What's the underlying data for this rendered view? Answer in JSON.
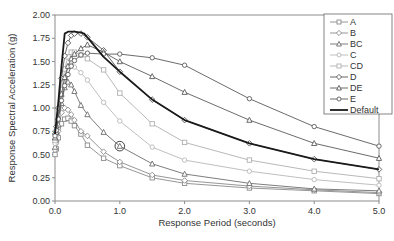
{
  "chart_data": {
    "type": "line",
    "title": "",
    "xlabel": "Response Period (seconds)",
    "ylabel": "Response Spectral Acceleration (g)",
    "xlim": [
      0.0,
      5.0
    ],
    "ylim": [
      0.0,
      2.0
    ],
    "x_ticks": [
      "0.0",
      "1.0",
      "2.0",
      "3.0",
      "4.0",
      "5.0"
    ],
    "y_ticks": [
      "0.00",
      "0.25",
      "0.50",
      "0.75",
      "1.00",
      "1.25",
      "1.50",
      "1.75",
      "2.00"
    ],
    "grid": false,
    "legend_position": "upper right",
    "series": [
      {
        "name": "A",
        "marker": "square",
        "color": "#8a8a8a",
        "x": [
          0.0,
          0.02,
          0.05,
          0.1,
          0.15,
          0.2,
          0.25,
          0.3,
          0.4,
          0.5,
          0.75,
          1.0,
          1.5,
          2.0,
          3.0,
          4.0,
          5.0
        ],
        "y": [
          0.5,
          0.56,
          0.68,
          0.83,
          0.88,
          0.89,
          0.86,
          0.81,
          0.72,
          0.6,
          0.46,
          0.38,
          0.25,
          0.19,
          0.14,
          0.11,
          0.08
        ]
      },
      {
        "name": "B",
        "marker": "diamond",
        "color": "#8a8a8a",
        "x": [
          0.0,
          0.02,
          0.05,
          0.1,
          0.15,
          0.2,
          0.25,
          0.3,
          0.4,
          0.5,
          0.75,
          1.0,
          1.5,
          2.0,
          3.0,
          4.0,
          5.0
        ],
        "y": [
          0.55,
          0.62,
          0.75,
          0.95,
          1.0,
          0.98,
          0.93,
          0.87,
          0.75,
          0.7,
          0.53,
          0.42,
          0.28,
          0.22,
          0.16,
          0.12,
          0.09
        ]
      },
      {
        "name": "BC",
        "marker": "triangle",
        "color": "#6e6e6e",
        "x": [
          0.0,
          0.02,
          0.05,
          0.1,
          0.15,
          0.2,
          0.25,
          0.3,
          0.4,
          0.5,
          0.75,
          1.0,
          1.5,
          2.0,
          3.0,
          4.0,
          5.0
        ],
        "y": [
          0.58,
          0.66,
          0.82,
          1.05,
          1.22,
          1.28,
          1.25,
          1.18,
          1.03,
          0.93,
          0.74,
          0.59,
          0.4,
          0.29,
          0.19,
          0.13,
          0.11
        ]
      },
      {
        "name": "C",
        "marker": "circle",
        "color": "#b8b8b8",
        "x": [
          0.0,
          0.02,
          0.05,
          0.1,
          0.15,
          0.2,
          0.25,
          0.3,
          0.4,
          0.5,
          0.75,
          1.0,
          1.5,
          2.0,
          3.0,
          4.0,
          5.0
        ],
        "y": [
          0.62,
          0.7,
          0.88,
          1.12,
          1.32,
          1.44,
          1.46,
          1.44,
          1.38,
          1.3,
          1.06,
          0.86,
          0.58,
          0.44,
          0.32,
          0.23,
          0.17
        ]
      },
      {
        "name": "CD",
        "marker": "square",
        "color": "#b0b0b0",
        "x": [
          0.0,
          0.02,
          0.05,
          0.1,
          0.15,
          0.2,
          0.25,
          0.3,
          0.4,
          0.5,
          0.75,
          1.0,
          1.5,
          2.0,
          3.0,
          4.0,
          5.0
        ],
        "y": [
          0.65,
          0.73,
          0.92,
          1.2,
          1.42,
          1.55,
          1.6,
          1.6,
          1.57,
          1.53,
          1.41,
          1.16,
          0.83,
          0.63,
          0.44,
          0.32,
          0.24
        ]
      },
      {
        "name": "D",
        "marker": "diamond",
        "color": "#555555",
        "x": [
          0.0,
          0.02,
          0.05,
          0.1,
          0.15,
          0.2,
          0.25,
          0.3,
          0.4,
          0.5,
          0.75,
          1.0,
          1.5,
          2.0,
          3.0,
          4.0,
          5.0
        ],
        "y": [
          0.72,
          0.8,
          1.0,
          1.32,
          1.56,
          1.7,
          1.78,
          1.8,
          1.8,
          1.76,
          1.62,
          1.39,
          1.09,
          0.87,
          0.62,
          0.45,
          0.34
        ]
      },
      {
        "name": "DE",
        "marker": "triangle",
        "color": "#5a5a5a",
        "x": [
          0.0,
          0.02,
          0.05,
          0.1,
          0.15,
          0.2,
          0.25,
          0.3,
          0.4,
          0.5,
          0.75,
          1.0,
          1.5,
          2.0,
          3.0,
          4.0,
          5.0
        ],
        "y": [
          0.68,
          0.74,
          0.9,
          1.15,
          1.33,
          1.45,
          1.53,
          1.58,
          1.64,
          1.68,
          1.6,
          1.5,
          1.34,
          1.17,
          0.87,
          0.62,
          0.46
        ]
      },
      {
        "name": "E",
        "marker": "circle",
        "color": "#5a5a5a",
        "x": [
          0.0,
          0.02,
          0.05,
          0.1,
          0.15,
          0.2,
          0.25,
          0.3,
          0.4,
          0.5,
          0.75,
          1.0,
          1.5,
          2.0,
          3.0,
          4.0,
          5.0
        ],
        "y": [
          0.7,
          0.76,
          0.88,
          1.08,
          1.24,
          1.36,
          1.45,
          1.51,
          1.57,
          1.59,
          1.58,
          1.58,
          1.54,
          1.46,
          1.1,
          0.8,
          0.59
        ]
      },
      {
        "name": "Default",
        "marker": "none",
        "color": "#1a1a1a",
        "x": [
          0.0,
          0.05,
          0.1,
          0.15,
          0.2,
          0.3,
          0.4,
          0.45,
          0.5,
          0.75,
          1.0,
          1.5,
          2.0,
          3.0,
          4.0,
          5.0
        ],
        "y": [
          0.72,
          1.05,
          1.45,
          1.8,
          1.82,
          1.82,
          1.81,
          1.8,
          1.76,
          1.55,
          1.39,
          1.09,
          0.87,
          0.62,
          0.45,
          0.34
        ]
      }
    ],
    "annotations": [
      {
        "type": "circle-highlight",
        "x": 1.0,
        "y": 0.59,
        "series": "BC"
      }
    ]
  },
  "legend": {
    "items": [
      "A",
      "B",
      "BC",
      "C",
      "CD",
      "D",
      "DE",
      "E",
      "Default"
    ]
  },
  "axes": {
    "x_title": "Response Period (seconds)",
    "y_title": "Response Spectral Acceleration (g)"
  }
}
